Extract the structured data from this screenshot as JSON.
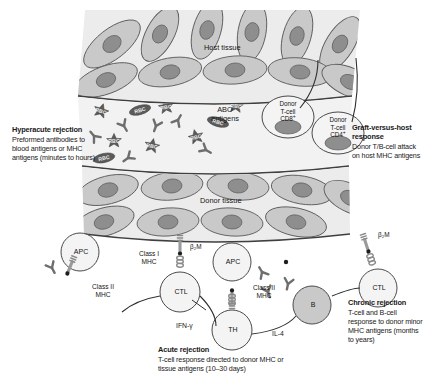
{
  "figure": {
    "tissues": [
      {
        "id": "host-tissue",
        "label": "Host tissue"
      },
      {
        "id": "abo-antigens",
        "label": "ABO antigens"
      },
      {
        "id": "donor-tissue",
        "label": "Donor tissue"
      }
    ],
    "annotations": [
      {
        "id": "hyperacute-rejection",
        "heading": "Hyperacute rejection",
        "body": "Preformed antibodies to blood antigens or MHC antigens (minutes to hours)"
      },
      {
        "id": "graft-versus-host-response",
        "heading": "Graft-versus-host response",
        "body": "Donor T/B-cell attack on host MHC antigens"
      },
      {
        "id": "chronic-rejection",
        "heading": "Chronic rejection",
        "body": "T-cell and B-cell response to donor minor MHC antigens (months to years)"
      },
      {
        "id": "acute-rejection",
        "heading": "Acute rejection",
        "body": "T-cell response directed to donor MHC or tissue antigens (10–30 days)"
      }
    ],
    "donor_tcells": [
      {
        "id": "donor-t-cell-cd8",
        "line1": "Donor",
        "line2": "T-cell",
        "line3": "CD8",
        "sup": "+"
      },
      {
        "id": "donor-t-cell-cd4",
        "line1": "Donor",
        "line2": "T-cell",
        "line3": "CD4",
        "sup": "+"
      }
    ],
    "cells": [
      {
        "id": "apc-left",
        "label": "APC"
      },
      {
        "id": "apc-center",
        "label": "APC"
      },
      {
        "id": "ctl-center",
        "label": "CTL"
      },
      {
        "id": "ctl-right",
        "label": "CTL"
      },
      {
        "id": "th-cell",
        "label": "TH"
      },
      {
        "id": "b-cell",
        "label": "B"
      }
    ],
    "mhc_labels": [
      {
        "id": "class-ii-mhc-left",
        "line1": "Class II",
        "line2": "MHC"
      },
      {
        "id": "class-i-mhc-center",
        "line1": "Class I",
        "line2": "MHC"
      },
      {
        "id": "class-ii-mhc-center",
        "line1": "Class II",
        "line2": "MHC"
      }
    ],
    "b2m_labels": [
      {
        "id": "b2m-center",
        "label": "β₂M"
      },
      {
        "id": "b2m-right",
        "label": "β₂M"
      }
    ],
    "cytokines": [
      {
        "id": "ifn-gamma",
        "label": "IFN-γ"
      },
      {
        "id": "il-4",
        "label": "IL-4"
      }
    ],
    "rbc_label": "RBC",
    "colors": {
      "cell_fill": "#c9c9c9",
      "nucleus_fill": "#8e8e8e",
      "band_fill": "#ececec",
      "rbc_fill": "#5b5b5b",
      "antibody": "#6e6e6e",
      "outline": "#4a4a4a",
      "text": "#151515"
    }
  }
}
